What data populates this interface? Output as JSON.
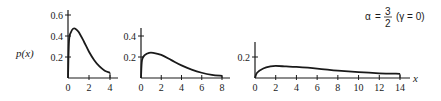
{
  "chart_data": [
    {
      "type": "line",
      "panel": 1,
      "ylabel": "p(x)",
      "xlabel": "",
      "xlim": [
        0,
        4
      ],
      "ylim": [
        0,
        0.6
      ],
      "xticks": [
        "0",
        "2",
        "4"
      ],
      "yticks": [
        "0.2",
        "0.4",
        "0.6"
      ],
      "x": [
        0,
        0.1,
        0.3,
        0.5,
        0.7,
        1.0,
        1.5,
        2.0,
        2.5,
        3.0,
        3.5,
        4.0
      ],
      "y": [
        0,
        0.36,
        0.44,
        0.47,
        0.47,
        0.44,
        0.35,
        0.25,
        0.17,
        0.11,
        0.07,
        0.05
      ],
      "grid": false
    },
    {
      "type": "line",
      "panel": 2,
      "xlabel": "",
      "xlim": [
        0,
        8
      ],
      "ylim": [
        0,
        0.4
      ],
      "xticks": [
        "0",
        "2",
        "4",
        "6",
        "8"
      ],
      "yticks": [
        "0.2",
        "0.4"
      ],
      "x": [
        0,
        0.1,
        0.4,
        0.8,
        1.2,
        2,
        3,
        4,
        5,
        6,
        7,
        8
      ],
      "y": [
        0,
        0.17,
        0.22,
        0.24,
        0.24,
        0.22,
        0.17,
        0.12,
        0.08,
        0.05,
        0.03,
        0.02
      ],
      "grid": false
    },
    {
      "type": "line",
      "panel": 3,
      "xlabel": "x",
      "xlim": [
        0,
        14
      ],
      "ylim": [
        0,
        0.2
      ],
      "xticks": [
        "0",
        "2",
        "4",
        "6",
        "8",
        "10",
        "12",
        "14"
      ],
      "yticks": [
        "0.2"
      ],
      "x": [
        0,
        0.2,
        0.8,
        1.5,
        2,
        3,
        4,
        6,
        8,
        10,
        12,
        14
      ],
      "y": [
        0,
        0.05,
        0.09,
        0.11,
        0.115,
        0.11,
        0.105,
        0.09,
        0.07,
        0.055,
        0.045,
        0.04
      ],
      "grid": false
    }
  ],
  "annotation": {
    "alpha_symbol": "α",
    "equals": "=",
    "numerator": "3",
    "denominator": "2",
    "gamma_text": "(γ = 0)"
  }
}
